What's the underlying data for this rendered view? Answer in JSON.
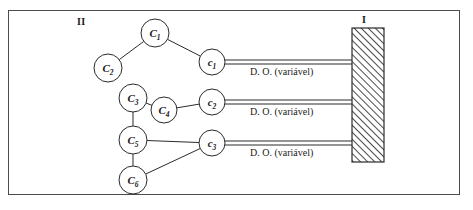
{
  "figure": {
    "group_ii_label": "II",
    "group_i_label": "I",
    "bar_fill": "#ffffff",
    "stroke_color": "#2b2b2b",
    "frame_color": "#4c4c4c"
  },
  "nodes_ii": [
    {
      "id": "C1",
      "base": "C",
      "sub": "1",
      "cx": 155,
      "cy": 33,
      "r": 14
    },
    {
      "id": "C2",
      "base": "C",
      "sub": "2",
      "cx": 108,
      "cy": 68,
      "r": 14
    },
    {
      "id": "C3",
      "base": "C",
      "sub": "3",
      "cx": 133,
      "cy": 98,
      "r": 14
    },
    {
      "id": "C4",
      "base": "C",
      "sub": "4",
      "cx": 164,
      "cy": 110,
      "r": 13
    },
    {
      "id": "C5",
      "base": "C",
      "sub": "5",
      "cx": 133,
      "cy": 140,
      "r": 14
    },
    {
      "id": "C6",
      "base": "C",
      "sub": "6",
      "cx": 133,
      "cy": 180,
      "r": 14
    }
  ],
  "nodes_c": [
    {
      "id": "c1",
      "base": "c",
      "sub": "1",
      "cx": 212,
      "cy": 62,
      "r": 13
    },
    {
      "id": "c2",
      "base": "c",
      "sub": "2",
      "cx": 212,
      "cy": 102,
      "r": 13
    },
    {
      "id": "c3",
      "base": "c",
      "sub": "3",
      "cx": 212,
      "cy": 143,
      "r": 13
    }
  ],
  "edges": [
    {
      "from": "C2",
      "to": "C1"
    },
    {
      "from": "C1",
      "to": "c1"
    },
    {
      "from": "C3",
      "to": "C4"
    },
    {
      "from": "C3",
      "to": "C5"
    },
    {
      "from": "C4",
      "to": "c2"
    },
    {
      "from": "C5",
      "to": "C6"
    },
    {
      "from": "C5",
      "to": "c3"
    },
    {
      "from": "C6",
      "to": "c3"
    }
  ],
  "connectors": [
    {
      "id": "conn1",
      "label": "D. O. (variável)",
      "from_node": "c1",
      "y": 62
    },
    {
      "id": "conn2",
      "label": "D. O. (variável)",
      "from_node": "c2",
      "y": 102
    },
    {
      "id": "conn3",
      "label": "D. O. (variável)",
      "from_node": "c3",
      "y": 143
    }
  ],
  "bar": {
    "x": 352,
    "y": 28,
    "width": 32,
    "height": 134,
    "hatch": "diagonal-45"
  }
}
